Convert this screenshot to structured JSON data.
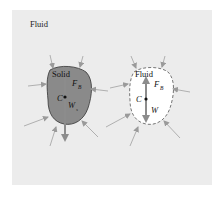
{
  "figure": {
    "title": "Fluid",
    "colors": {
      "background": "#ececec",
      "solid_fill": "#8a8a8a",
      "arrow": "#9a9a9a",
      "outline": "#333333"
    }
  },
  "left_body": {
    "label": "Solid",
    "centroid_label": "C",
    "buoyancy_label": "F",
    "buoyancy_subscript": "B",
    "weight_label": "W",
    "weight_subscript": "s"
  },
  "right_body": {
    "label": "Fluid",
    "centroid_label": "C",
    "buoyancy_label": "F",
    "buoyancy_subscript": "B",
    "weight_label": "W"
  }
}
